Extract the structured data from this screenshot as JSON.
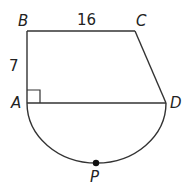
{
  "diagram": {
    "points": {
      "A": {
        "label": "A",
        "x": 27,
        "y": 103
      },
      "B": {
        "label": "B",
        "x": 27,
        "y": 31
      },
      "C": {
        "label": "C",
        "x": 135,
        "y": 31
      },
      "D": {
        "label": "D",
        "x": 166,
        "y": 103
      },
      "P": {
        "label": "P",
        "x": 96,
        "y": 163
      }
    },
    "measures": {
      "BC": "16",
      "AB": "7"
    },
    "right_angle_at": "A",
    "arc": "semicircle AD through P",
    "colors": {
      "stroke": "#333333",
      "text": "#222222"
    }
  }
}
